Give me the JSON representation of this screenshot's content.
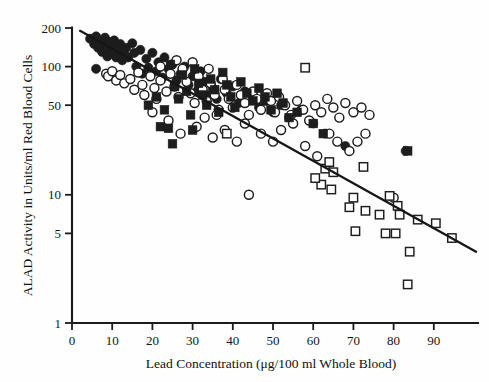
{
  "chart_data": {
    "type": "scatter",
    "title": "",
    "xlabel": "Lead Concentration (μg/100 ml Whole Blood)",
    "ylabel": "ALAD Activity in Units/ml Red Blood Cells",
    "xlim": [
      0,
      99
    ],
    "ylim": [
      1,
      230
    ],
    "yscale": "log",
    "grid": false,
    "legend": "none",
    "xticks": [
      0,
      10,
      20,
      30,
      40,
      50,
      60,
      70,
      80,
      90
    ],
    "xtick_labels": [
      "0",
      "10",
      "20",
      "30",
      "40",
      "50",
      "60",
      "70",
      "80",
      "90"
    ],
    "yticks": [
      1,
      5,
      10,
      50,
      100,
      200
    ],
    "ytick_labels": [
      "1",
      "5",
      "10",
      "50",
      "100",
      "200"
    ],
    "trendline": {
      "label": "regression-line",
      "x_start": 2.0,
      "y_start": 190,
      "x_end": 100.5,
      "y_end": 3.6
    },
    "series": [
      {
        "name": "filled-circle",
        "marker": "filled-circle",
        "points": [
          [
            4.5,
            165
          ],
          [
            5.5,
            150
          ],
          [
            6.0,
            172
          ],
          [
            6.5,
            140
          ],
          [
            7.0,
            158
          ],
          [
            7.5,
            130
          ],
          [
            8.0,
            148
          ],
          [
            8.2,
            168
          ],
          [
            8.8,
            120
          ],
          [
            9.0,
            142
          ],
          [
            9.5,
            155
          ],
          [
            9.8,
            128
          ],
          [
            10.2,
            138
          ],
          [
            10.5,
            160
          ],
          [
            11.0,
            118
          ],
          [
            11.3,
            145
          ],
          [
            11.8,
            132
          ],
          [
            12.0,
            150
          ],
          [
            12.5,
            112
          ],
          [
            13.0,
            126
          ],
          [
            6.0,
            96
          ],
          [
            13.5,
            140
          ],
          [
            14.0,
            118
          ],
          [
            15.0,
            152
          ],
          [
            15.5,
            128
          ],
          [
            16.0,
            100
          ],
          [
            17.0,
            135
          ],
          [
            17.5,
            88
          ],
          [
            18.5,
            115
          ],
          [
            19.0,
            98
          ],
          [
            20.0,
            128
          ],
          [
            21.0,
            92
          ],
          [
            21.5,
            108
          ],
          [
            22.5,
            82
          ],
          [
            23.0,
            118
          ],
          [
            24.0,
            96
          ],
          [
            25.0,
            104
          ],
          [
            26.0,
            78
          ],
          [
            27.0,
            88
          ],
          [
            28.0,
            100
          ],
          [
            29.0,
            72
          ],
          [
            30.0,
            84
          ],
          [
            31.0,
            64
          ],
          [
            32.0,
            92
          ],
          [
            33.0,
            76
          ],
          [
            34.0,
            60
          ],
          [
            35.0,
            68
          ],
          [
            36.0,
            56
          ],
          [
            37.0,
            80
          ],
          [
            38.5,
            62
          ],
          [
            40.0,
            70
          ],
          [
            41.5,
            52
          ],
          [
            43.0,
            64
          ],
          [
            45.0,
            58
          ],
          [
            46.5,
            48
          ],
          [
            48.0,
            54
          ],
          [
            50.0,
            44
          ],
          [
            52.0,
            50
          ],
          [
            54.0,
            40
          ],
          [
            57.0,
            46
          ],
          [
            60.0,
            36
          ],
          [
            63.0,
            30
          ],
          [
            68.0,
            24
          ],
          [
            83.0,
            22
          ]
        ]
      },
      {
        "name": "open-circle",
        "marker": "open-circle",
        "points": [
          [
            8.5,
            88
          ],
          [
            9.0,
            84
          ],
          [
            10.0,
            92
          ],
          [
            11.0,
            78
          ],
          [
            12.0,
            86
          ],
          [
            13.0,
            74
          ],
          [
            14.5,
            80
          ],
          [
            15.5,
            66
          ],
          [
            16.5,
            90
          ],
          [
            17.5,
            72
          ],
          [
            18.0,
            60
          ],
          [
            19.5,
            84
          ],
          [
            20.5,
            68
          ],
          [
            21.0,
            56
          ],
          [
            22.0,
            78
          ],
          [
            23.5,
            64
          ],
          [
            24.5,
            88
          ],
          [
            25.5,
            70
          ],
          [
            26.5,
            58
          ],
          [
            27.5,
            96
          ],
          [
            28.5,
            76
          ],
          [
            29.5,
            62
          ],
          [
            30.5,
            52
          ],
          [
            31.5,
            84
          ],
          [
            32.5,
            66
          ],
          [
            33.5,
            54
          ],
          [
            34.5,
            74
          ],
          [
            35.5,
            60
          ],
          [
            36.5,
            46
          ],
          [
            37.5,
            80
          ],
          [
            38.0,
            66
          ],
          [
            39.0,
            56
          ],
          [
            40.0,
            48
          ],
          [
            41.0,
            72
          ],
          [
            42.0,
            60
          ],
          [
            43.0,
            52
          ],
          [
            44.0,
            42
          ],
          [
            45.0,
            64
          ],
          [
            46.0,
            56
          ],
          [
            47.0,
            46
          ],
          [
            48.5,
            62
          ],
          [
            49.5,
            54
          ],
          [
            50.5,
            44
          ],
          [
            51.5,
            58
          ],
          [
            53.0,
            50
          ],
          [
            54.5,
            42
          ],
          [
            56.0,
            54
          ],
          [
            57.5,
            46
          ],
          [
            59.0,
            38
          ],
          [
            60.5,
            50
          ],
          [
            62.0,
            44
          ],
          [
            63.5,
            56
          ],
          [
            65.0,
            48
          ],
          [
            66.5,
            40
          ],
          [
            68.0,
            52
          ],
          [
            70.0,
            44
          ],
          [
            72.0,
            48
          ],
          [
            74.0,
            42
          ],
          [
            22.0,
            100
          ],
          [
            26.0,
            112
          ],
          [
            30.0,
            108
          ],
          [
            34.0,
            96
          ],
          [
            20.0,
            44
          ],
          [
            24.0,
            38
          ],
          [
            27.0,
            30
          ],
          [
            31.0,
            34
          ],
          [
            35.0,
            28
          ],
          [
            38.0,
            32
          ],
          [
            41.0,
            26
          ],
          [
            44.0,
            10
          ],
          [
            47.0,
            30
          ],
          [
            50.0,
            26
          ],
          [
            52.0,
            32
          ],
          [
            55.0,
            36
          ],
          [
            58.0,
            24
          ],
          [
            61.0,
            20
          ],
          [
            64.0,
            30
          ],
          [
            66.0,
            26
          ],
          [
            69.0,
            22
          ],
          [
            71.0,
            26
          ],
          [
            73.0,
            30
          ],
          [
            33.0,
            40
          ],
          [
            36.0,
            42
          ],
          [
            43.0,
            36
          ],
          [
            80.0,
            9.5
          ]
        ]
      },
      {
        "name": "filled-square",
        "marker": "filled-square",
        "points": [
          [
            19.0,
            50
          ],
          [
            21.0,
            58
          ],
          [
            23.0,
            46
          ],
          [
            24.5,
            104
          ],
          [
            25.5,
            70
          ],
          [
            26.5,
            56
          ],
          [
            27.5,
            86
          ],
          [
            28.5,
            64
          ],
          [
            29.5,
            42
          ],
          [
            30.5,
            96
          ],
          [
            31.5,
            74
          ],
          [
            32.5,
            60
          ],
          [
            33.5,
            50
          ],
          [
            34.5,
            80
          ],
          [
            35.5,
            66
          ],
          [
            36.5,
            44
          ],
          [
            37.5,
            90
          ],
          [
            38.5,
            72
          ],
          [
            39.5,
            58
          ],
          [
            40.5,
            48
          ],
          [
            42.0,
            76
          ],
          [
            43.5,
            62
          ],
          [
            45.0,
            54
          ],
          [
            46.5,
            68
          ],
          [
            48.0,
            58
          ],
          [
            49.5,
            46
          ],
          [
            51.0,
            62
          ],
          [
            52.5,
            52
          ],
          [
            54.0,
            40
          ],
          [
            56.0,
            44
          ],
          [
            22.0,
            34
          ],
          [
            24.0,
            33
          ],
          [
            25.0,
            25
          ],
          [
            30.0,
            32
          ],
          [
            60.0,
            36
          ],
          [
            62.5,
            30
          ],
          [
            83.5,
            22
          ]
        ]
      },
      {
        "name": "open-square",
        "marker": "open-square",
        "points": [
          [
            38.5,
            30
          ],
          [
            58.0,
            98
          ],
          [
            63.0,
            16
          ],
          [
            64.0,
            18
          ],
          [
            65.0,
            15
          ],
          [
            62.0,
            12
          ],
          [
            70.0,
            9.5
          ],
          [
            69.0,
            8.0
          ],
          [
            64.5,
            11.0
          ],
          [
            72.5,
            16.5
          ],
          [
            73.0,
            7.5
          ],
          [
            76.5,
            7.0
          ],
          [
            79.0,
            9.8
          ],
          [
            81.0,
            8.2
          ],
          [
            81.5,
            7.0
          ],
          [
            70.5,
            5.2
          ],
          [
            78.0,
            5.0
          ],
          [
            80.5,
            5.0
          ],
          [
            86.0,
            6.4
          ],
          [
            90.5,
            6.0
          ],
          [
            84.0,
            3.6
          ],
          [
            83.5,
            2.0
          ],
          [
            94.5,
            4.6
          ],
          [
            60.5,
            13.5
          ]
        ]
      }
    ]
  },
  "axes": {
    "x_tick_text": [
      "0",
      "10",
      "20",
      "30",
      "40",
      "50",
      "60",
      "70",
      "80",
      "90"
    ],
    "y_tick_text": [
      "200",
      "100",
      "50",
      "10",
      "5",
      "1"
    ]
  }
}
